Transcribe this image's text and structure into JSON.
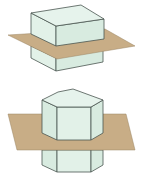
{
  "figures": [
    {
      "name": "rectangular-prism-cut-by-plane",
      "solid": "rectangular prism",
      "cutting_plane": "horizontal plane"
    },
    {
      "name": "hexagonal-prism-cut-by-plane",
      "solid": "hexagonal prism",
      "cutting_plane": "horizontal plane"
    }
  ],
  "colors": {
    "solid_face": "#e2f1e8",
    "solid_edge": "#4a5550",
    "plane": "#c8ad86",
    "background": "#ffffff"
  }
}
